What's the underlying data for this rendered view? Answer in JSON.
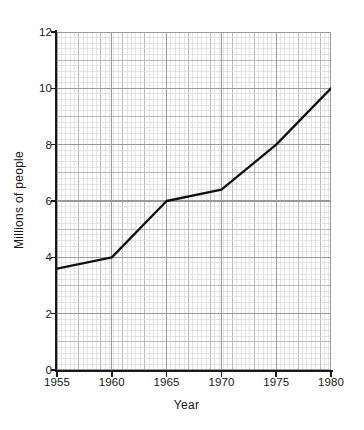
{
  "chart_data": {
    "type": "line",
    "title": "",
    "xlabel": "Year",
    "ylabel": "Millions of people",
    "x": [
      1955,
      1960,
      1965,
      1970,
      1975,
      1980
    ],
    "values": [
      3.6,
      4.0,
      6.0,
      6.4,
      8.0,
      10.0
    ],
    "series": [
      {
        "name": "Population",
        "values": [
          3.6,
          4.0,
          6.0,
          6.4,
          8.0,
          10.0
        ]
      }
    ],
    "xlim": [
      1955,
      1980
    ],
    "ylim": [
      0,
      12
    ],
    "xticks": [
      1955,
      1960,
      1965,
      1970,
      1975,
      1980
    ],
    "yticks": [
      0,
      2,
      4,
      6,
      8,
      10,
      12
    ],
    "xtick_labels": [
      "1955",
      "1960",
      "1965",
      "1970",
      "1975",
      "1980"
    ],
    "ytick_labels": [
      "0",
      "2",
      "4",
      "6",
      "8",
      "10",
      "12"
    ],
    "grid": true,
    "grid_minor": true,
    "legend": false,
    "legend_position": "none",
    "line_color": "#111111",
    "grid_major_color": "#b4b4b4",
    "grid_minor_color": "#d8d8d8",
    "axis_color": "#1a1a1a",
    "background_color": "#ffffff"
  }
}
